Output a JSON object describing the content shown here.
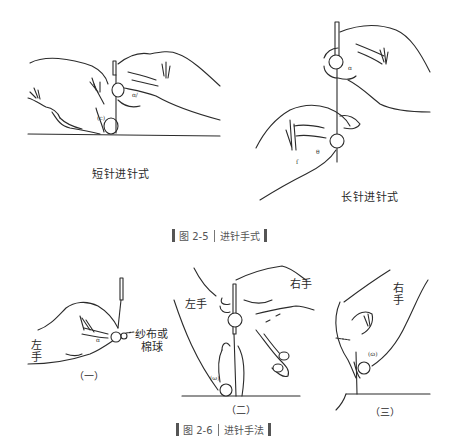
{
  "figure_2_5": {
    "left_panel": {
      "caption": "短针进针式"
    },
    "right_panel": {
      "caption": "长针进针式"
    },
    "title": {
      "number": "图 2-5",
      "text": "进针手式"
    }
  },
  "figure_2_6": {
    "panel_1": {
      "label_left_hand": [
        "左",
        "手"
      ],
      "label_gauze": "纱布或",
      "label_gauze_2": "棉球",
      "index": "（一）"
    },
    "panel_2": {
      "label_left_hand": "左手",
      "label_right_hand": "右手",
      "index": "（二）"
    },
    "panel_3": {
      "label_right_hand": [
        "右",
        "手"
      ],
      "index": "（三）"
    },
    "title": {
      "number": "图 2-6",
      "text": "进针手法"
    }
  },
  "colors": {
    "ink": "#2b2b2b",
    "title_bar": "#555555",
    "background": "#ffffff"
  }
}
